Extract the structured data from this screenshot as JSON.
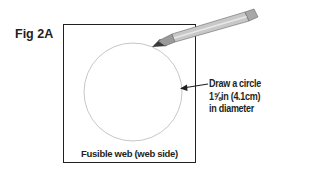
{
  "figure": {
    "label": "Fig 2A",
    "caption": "Fusible web (web side)",
    "annotation": {
      "lines": [
        "Draw a circle",
        "1⅝in (4.1cm)",
        "in diameter"
      ]
    },
    "icons": {
      "pencil": "pencil-icon",
      "arrow": "arrow-left-icon"
    },
    "colors": {
      "text": "#231f20",
      "outline": "#231f20",
      "circle": "#b0b0b0",
      "pencil_body": "#c8c8c8"
    }
  }
}
